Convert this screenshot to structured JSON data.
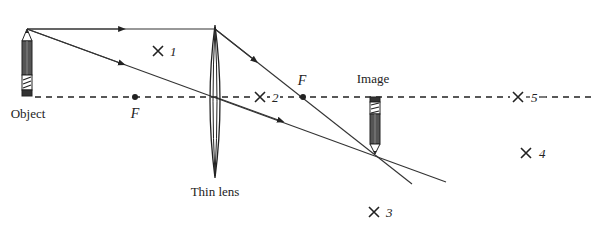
{
  "diagram": {
    "type": "thin-lens-ray-diagram",
    "labels": {
      "object": "Object",
      "image": "Image",
      "lens": "Thin lens",
      "focal_left": "F",
      "focal_right": "F"
    },
    "positions": [
      {
        "id": "1",
        "label": "1",
        "x": 158,
        "y": 51
      },
      {
        "id": "2",
        "label": "2",
        "x": 260,
        "y": 97
      },
      {
        "id": "3",
        "label": "3",
        "x": 374,
        "y": 212
      },
      {
        "id": "4",
        "label": "4",
        "x": 526,
        "y": 153
      },
      {
        "id": "5",
        "label": "5",
        "x": 518,
        "y": 97
      }
    ],
    "colors": {
      "line": "#333333",
      "pencil_body": "#555555",
      "background": "#ffffff"
    }
  }
}
